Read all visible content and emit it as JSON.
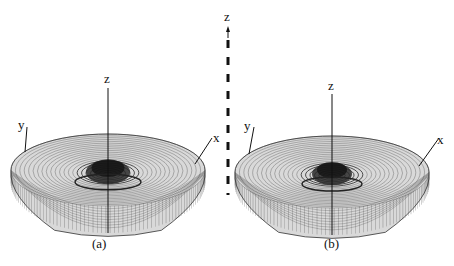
{
  "figure": {
    "panels": [
      {
        "id": "a",
        "caption": "(a)",
        "axis_labels": {
          "x": "x",
          "y": "y",
          "z": "z"
        }
      },
      {
        "id": "b",
        "caption": "(b)",
        "axis_labels": {
          "x": "x",
          "y": "y",
          "z": "z"
        }
      }
    ],
    "center_axis_label": "z",
    "colors": {
      "wire": "#333333",
      "background": "#ffffff"
    }
  }
}
